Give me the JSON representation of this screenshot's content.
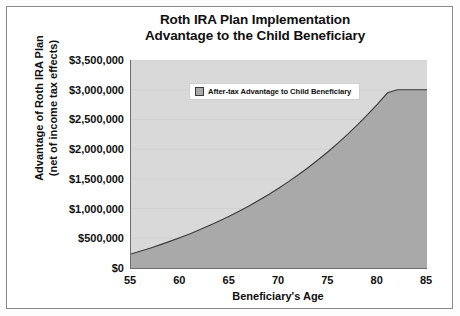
{
  "chart_data": {
    "type": "area",
    "title": "Roth IRA Plan Implementation Advantage to the Child Beneficiary",
    "title_lines": [
      "Roth IRA Plan Implementation",
      "Advantage to the Child Beneficiary"
    ],
    "xlabel": "Beneficiary's Age",
    "ylabel": "Advantage of Roth IRA Plan (net of income tax effects)",
    "ylabel_lines": [
      "Advantage of Roth IRA Plan",
      "(net of income tax effects)"
    ],
    "legend": [
      {
        "name": "After-tax Advantage to Child Beneficiary",
        "color": "#a9a9a9"
      }
    ],
    "legend_position": "upper-center-inside",
    "grid": true,
    "xlim": [
      55,
      85
    ],
    "ylim": [
      0,
      3500000
    ],
    "xticks": [
      55,
      60,
      65,
      70,
      75,
      80,
      85
    ],
    "xtick_labels": [
      "55",
      "60",
      "65",
      "70",
      "75",
      "80",
      "85"
    ],
    "yticks": [
      0,
      500000,
      1000000,
      1500000,
      2000000,
      2500000,
      3000000,
      3500000
    ],
    "ytick_labels": [
      "$0",
      "$500,000",
      "$1,000,000",
      "$1,500,000",
      "$2,000,000",
      "$2,500,000",
      "$3,000,000",
      "$3,500,000"
    ],
    "x": [
      55,
      56,
      57,
      58,
      59,
      60,
      61,
      62,
      63,
      64,
      65,
      66,
      67,
      68,
      69,
      70,
      71,
      72,
      73,
      74,
      75,
      76,
      77,
      78,
      79,
      80,
      81,
      82,
      83,
      84,
      85
    ],
    "series": [
      {
        "name": "After-tax Advantage to Child Beneficiary",
        "values": [
          235000,
          285000,
          338000,
          393000,
          452000,
          513000,
          578000,
          647000,
          719000,
          795000,
          875000,
          960000,
          1049000,
          1143000,
          1242000,
          1347000,
          1457000,
          1573000,
          1696000,
          1825000,
          1961000,
          2105000,
          2256000,
          2416000,
          2584000,
          2761000,
          2948000,
          3000000,
          3000000,
          3000000,
          3000000
        ]
      }
    ],
    "colors": {
      "area_fill": "#a9a9a9",
      "area_line": "#3a3a3a",
      "plot_background": "#d9d9d9",
      "axis": "#6e6e6e",
      "text": "#101010",
      "frame": "#8a8a8a"
    }
  }
}
